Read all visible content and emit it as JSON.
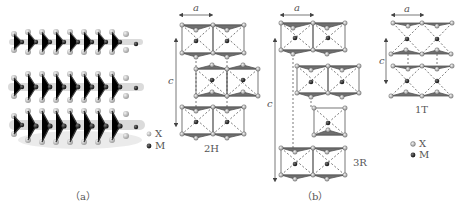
{
  "panels": {
    "a": {
      "caption": "（a）",
      "description": "3D perspective of three stacked MX2 layers",
      "legend": [
        {
          "symbol": "X",
          "color": "#c9c9c9"
        },
        {
          "symbol": "M",
          "color": "#2a2a2a"
        }
      ]
    },
    "b": {
      "caption": "（b）",
      "polytypes": [
        {
          "name": "2H",
          "a_label": "a",
          "c_label": "c"
        },
        {
          "name": "3R",
          "a_label": "a",
          "c_label": "c"
        },
        {
          "name": "1T",
          "a_label": "a",
          "c_label": "c"
        }
      ],
      "legend": [
        {
          "symbol": "X",
          "color": "#9a9a9a"
        },
        {
          "symbol": "M",
          "color": "#3a3a3a"
        }
      ]
    }
  },
  "colors": {
    "x_atom": "#bdbdbd",
    "m_atom": "#2b2b2b",
    "bond": "#555555",
    "triangle": "#6f6f6f"
  }
}
